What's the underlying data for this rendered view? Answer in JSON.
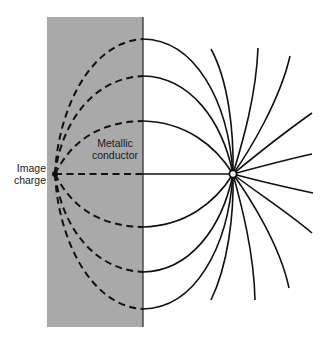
{
  "diagram": {
    "type": "electric-field-lines-image-charge",
    "labels": {
      "image_charge_line1": "Image",
      "image_charge_line2": "charge",
      "conductor_line1": "Metallic",
      "conductor_line2": "conductor"
    },
    "colors": {
      "conductor_fill": "#a9a9a9",
      "line": "#111111",
      "background": "#ffffff"
    },
    "elements": {
      "conductor": {
        "x": 47,
        "y": 17,
        "width": 96,
        "height": 310
      },
      "real_charge": {
        "x": 233,
        "y": 174,
        "symbol": "small open circle"
      },
      "image_charge": {
        "x": 55,
        "y": 174,
        "symbol": "filled dot"
      },
      "field_lines_crossing_boundary_y": [
        39,
        76,
        121,
        174,
        227,
        272,
        309
      ],
      "outward_field_lines_count": 10
    }
  }
}
